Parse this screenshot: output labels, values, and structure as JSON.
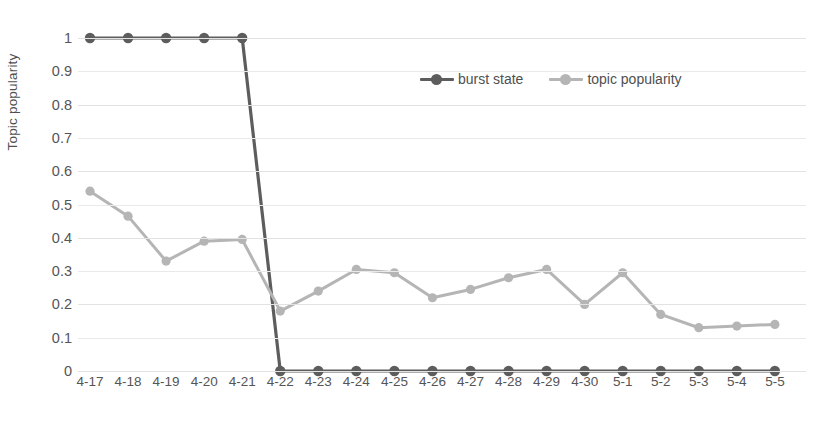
{
  "chart_data": {
    "type": "line",
    "title": "",
    "xlabel": "",
    "ylabel": "Topic popularity",
    "ylim": [
      0,
      1
    ],
    "ytick_step": 0.1,
    "yticks": [
      "1",
      "0.9",
      "0.8",
      "0.7",
      "0.6",
      "0.5",
      "0.4",
      "0.3",
      "0.2",
      "0.1",
      "0"
    ],
    "grid": true,
    "legend_position": "top-center",
    "categories": [
      "4-17",
      "4-18",
      "4-19",
      "4-20",
      "4-21",
      "4-22",
      "4-23",
      "4-24",
      "4-25",
      "4-26",
      "4-27",
      "4-28",
      "4-29",
      "4-30",
      "5-1",
      "5-2",
      "5-3",
      "5-4",
      "5-5"
    ],
    "series": [
      {
        "name": "burst state",
        "color": "#5d5d5d",
        "marker": "circle",
        "values": [
          1,
          1,
          1,
          1,
          1,
          0,
          0,
          0,
          0,
          0,
          0,
          0,
          0,
          0,
          0,
          0,
          0,
          0,
          0
        ]
      },
      {
        "name": "topic popularity",
        "color": "#b5b5b5",
        "marker": "circle",
        "values": [
          0.54,
          0.465,
          0.33,
          0.39,
          0.395,
          0.18,
          0.24,
          0.305,
          0.295,
          0.22,
          0.245,
          0.28,
          0.305,
          0.2,
          0.295,
          0.17,
          0.13,
          0.135,
          0.14
        ]
      }
    ]
  },
  "legend": {
    "entries": [
      {
        "label": "burst state"
      },
      {
        "label": "topic popularity"
      }
    ]
  },
  "axes": {
    "y_title": "Topic popularity"
  },
  "colors": {
    "burst_state": "#5d5d5d",
    "topic_popularity": "#b5b5b5",
    "gridline": "#e2e2e2",
    "text": "#555555",
    "background": "#ffffff"
  }
}
